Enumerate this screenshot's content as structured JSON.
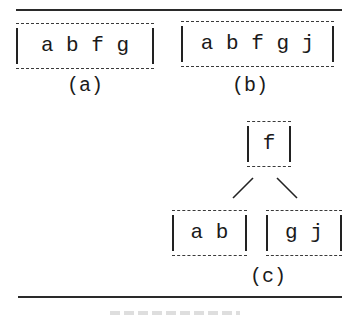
{
  "figure": {
    "panels": [
      {
        "id": "a",
        "label": "(a)",
        "description": "single node",
        "nodes": [
          {
            "keys": "a b f g"
          }
        ]
      },
      {
        "id": "b",
        "label": "(b)",
        "description": "node after insertion of j (overflow)",
        "nodes": [
          {
            "keys": "a b f g j"
          }
        ]
      },
      {
        "id": "c",
        "label": "(c)",
        "description": "node split with f promoted as root",
        "root": {
          "keys": "f"
        },
        "children": [
          {
            "keys": "a b"
          },
          {
            "keys": "g j"
          }
        ]
      }
    ],
    "edges": [
      {
        "from": "f",
        "to": "a b"
      },
      {
        "from": "f",
        "to": "g j"
      }
    ],
    "colors": {
      "ink": "#1a1a1a",
      "background": "#ffffff",
      "dash": "#3a3a3a"
    }
  }
}
